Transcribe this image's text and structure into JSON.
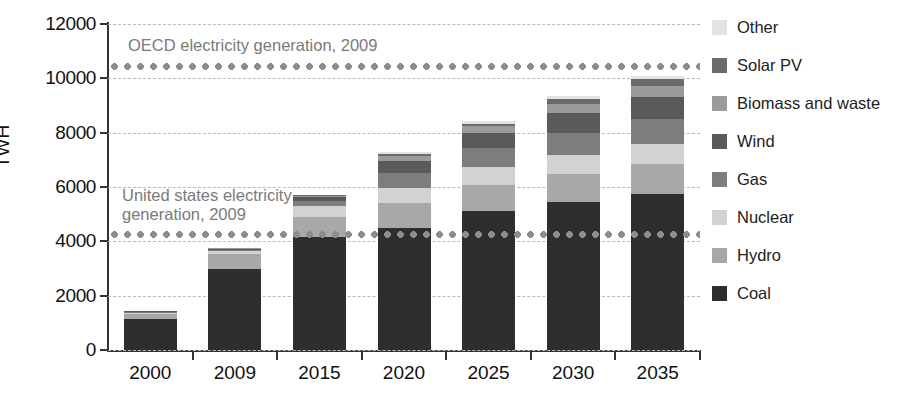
{
  "chart_data": {
    "type": "bar",
    "stacked": true,
    "title": "",
    "xlabel": "",
    "ylabel": "TWH",
    "ylim": [
      0,
      12000
    ],
    "ytick_values": [
      0,
      2000,
      4000,
      6000,
      8000,
      10000,
      12000
    ],
    "ytick_labels": [
      "0",
      "2000",
      "4000",
      "6000",
      "8000",
      "10000",
      "12000"
    ],
    "grid": true,
    "legend_position": "right",
    "categories": [
      "2000",
      "2009",
      "2015",
      "2020",
      "2025",
      "2030",
      "2035"
    ],
    "series": [
      {
        "name": "Coal",
        "color": "#2e2e2e",
        "values": [
          1150,
          3000,
          4150,
          4500,
          5100,
          5450,
          5750
        ]
      },
      {
        "name": "Hydro",
        "color": "#a8a8a8",
        "values": [
          170,
          530,
          760,
          900,
          980,
          1030,
          1080
        ]
      },
      {
        "name": "Nuclear",
        "color": "#d2d2d2",
        "values": [
          60,
          120,
          400,
          570,
          640,
          700,
          760
        ]
      },
      {
        "name": "Gas",
        "color": "#7d7d7d",
        "values": [
          30,
          50,
          180,
          560,
          700,
          820,
          900
        ]
      },
      {
        "name": "Wind",
        "color": "#5a5a5a",
        "values": [
          20,
          30,
          140,
          430,
          560,
          720,
          840
        ]
      },
      {
        "name": "Biomass and waste",
        "color": "#9b9b9b",
        "values": [
          10,
          15,
          50,
          180,
          250,
          330,
          400
        ]
      },
      {
        "name": "Solar PV",
        "color": "#6b6b6b",
        "values": [
          5,
          10,
          15,
          80,
          110,
          180,
          230
        ]
      },
      {
        "name": "Other",
        "color": "#e3e3e3",
        "values": [
          5,
          5,
          10,
          60,
          80,
          120,
          140
        ]
      }
    ],
    "annotations": [
      {
        "id": "oecd",
        "label": "OECD electricity generation, 2009",
        "value": 10450
      },
      {
        "id": "usa",
        "label": "United states electricity\ngeneration, 2009",
        "value": 4250
      }
    ]
  },
  "legend": {
    "items": [
      {
        "label": "Other",
        "color": "#e3e3e3"
      },
      {
        "label": "Solar PV",
        "color": "#6b6b6b"
      },
      {
        "label": "Biomass and waste",
        "color": "#9b9b9b"
      },
      {
        "label": "Wind",
        "color": "#5a5a5a"
      },
      {
        "label": "Gas",
        "color": "#7d7d7d"
      },
      {
        "label": "Nuclear",
        "color": "#d2d2d2"
      },
      {
        "label": "Hydro",
        "color": "#a8a8a8"
      },
      {
        "label": "Coal",
        "color": "#2e2e2e"
      }
    ]
  }
}
